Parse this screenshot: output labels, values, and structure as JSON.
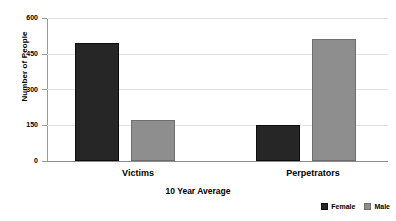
{
  "chart_data": {
    "type": "bar",
    "title": "",
    "xlabel": "10 Year Average",
    "ylabel": "Number of People",
    "categories": [
      "Victims",
      "Perpetrators"
    ],
    "series": [
      {
        "name": "Female",
        "color": "#262626",
        "values": [
          495,
          150
        ]
      },
      {
        "name": "Male",
        "color": "#8e8e8e",
        "values": [
          170,
          510
        ]
      }
    ],
    "ylim": [
      0,
      600
    ],
    "yticks": [
      0,
      150,
      300,
      450,
      600
    ],
    "ytick_labels": [
      "0",
      "150",
      "300",
      "450",
      "600"
    ],
    "grid": true,
    "legend_position": "bottom-right"
  },
  "axis": {
    "y_title": "Number of People",
    "x_title": "10 Year Average",
    "ticks": [
      {
        "value": 600,
        "label": "600"
      },
      {
        "value": 450,
        "label": "450"
      },
      {
        "value": 300,
        "label": "300"
      },
      {
        "value": 150,
        "label": "150"
      },
      {
        "value": 0,
        "label": "0"
      }
    ]
  },
  "categories": [
    {
      "label": "Victims"
    },
    {
      "label": "Perpetrators"
    }
  ],
  "legend": {
    "items": [
      {
        "label": "Female"
      },
      {
        "label": "Male"
      }
    ]
  }
}
